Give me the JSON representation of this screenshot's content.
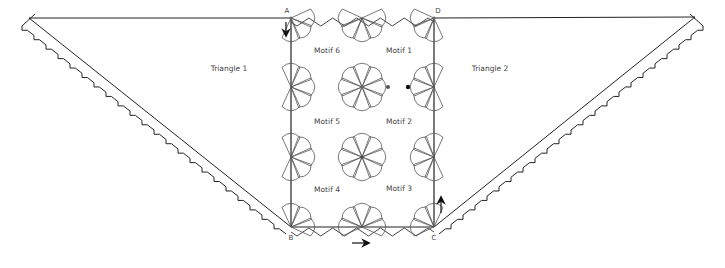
{
  "diagram": {
    "labels": {
      "triangle_1": "Triangle 1",
      "triangle_2": "Triangle 2",
      "motifs": [
        "Motif 1",
        "Motif 2",
        "Motif 3",
        "Motif 4",
        "Motif 5",
        "Motif 6"
      ]
    },
    "corners": {
      "a": "A",
      "b": "B",
      "c": "C",
      "d": "D"
    },
    "arrows": [
      {
        "name": "down-arrow-at-a",
        "direction": "down"
      },
      {
        "name": "right-arrow-bottom-edge",
        "direction": "right"
      },
      {
        "name": "up-arrow-at-c",
        "direction": "up"
      }
    ],
    "colors": {
      "line": "#222222",
      "motif_line": "#555555",
      "background": "#ffffff"
    }
  }
}
